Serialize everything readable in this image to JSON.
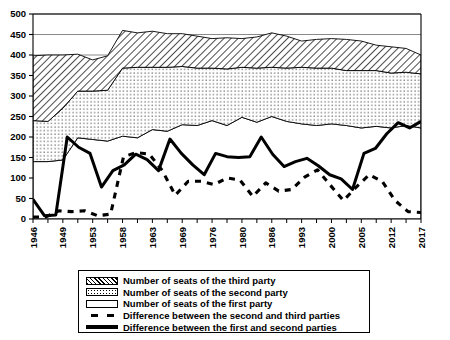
{
  "chart": {
    "type": "area",
    "title": "",
    "xlabel": "",
    "ylabel": "",
    "ylim": [
      0,
      500
    ],
    "ytick_step": 50,
    "grid": "horizontal gridlines at 400, 450, 500",
    "legend_position": "bottom",
    "colors": {
      "line": "#000000",
      "axis": "#000000",
      "gridline": "#808080",
      "background": "#ffffff"
    }
  },
  "legend": {
    "items": [
      {
        "label": "Number of seats of the third party",
        "swatch": "hatched"
      },
      {
        "label": "Number of seats of the second party",
        "swatch": "dotted"
      },
      {
        "label": "Number of seats of the first party",
        "swatch": "plain-white"
      },
      {
        "label": "Difference between the second and third parties",
        "swatch": "dashed-line"
      },
      {
        "label": "Difference between the first and second parties",
        "swatch": "solid-line"
      }
    ]
  },
  "axes": {
    "y_ticks": [
      "0",
      "50",
      "100",
      "150",
      "200",
      "250",
      "300",
      "350",
      "400",
      "450",
      "500"
    ],
    "x_tick_labels": [
      "1946",
      "1949",
      "1953",
      "1958",
      "1963",
      "1969",
      "1976",
      "1980",
      "1986",
      "1993",
      "2000",
      "2005",
      "2012",
      "2017"
    ],
    "x_tick_label_indices": [
      0,
      2,
      4,
      6,
      8,
      10,
      12,
      14,
      16,
      18,
      20,
      22,
      24,
      26
    ]
  },
  "chart_data": {
    "type": "area",
    "title": "",
    "xlabel": "",
    "ylabel": "",
    "ylim": [
      0,
      500
    ],
    "grid": true,
    "legend_position": "bottom",
    "x": [
      "1946",
      "1947",
      "1949",
      "1951",
      "1953",
      "1955",
      "1958",
      "1960",
      "1963",
      "1966",
      "1969",
      "1972",
      "1976",
      "1978",
      "1980",
      "1983",
      "1986",
      "1990",
      "1993",
      "1996",
      "2000",
      "2003",
      "2005",
      "2009",
      "2012",
      "2015",
      "2017"
    ],
    "categories": [
      "1946",
      "1947",
      "1949",
      "1951",
      "1953",
      "1955",
      "1958",
      "1960",
      "1963",
      "1966",
      "1969",
      "1972",
      "1976",
      "1978",
      "1980",
      "1983",
      "1986",
      "1990",
      "1993",
      "1996",
      "2000",
      "2003",
      "2005",
      "2009",
      "2012",
      "2015",
      "2017"
    ],
    "series": [
      {
        "name": "Number of seats of the first party",
        "stacked": true,
        "fill": "plain-white",
        "values": [
          140,
          140,
          144,
          198,
          194,
          190,
          202,
          198,
          218,
          214,
          230,
          228,
          240,
          228,
          248,
          236,
          250,
          238,
          232,
          228,
          232,
          228,
          222,
          226,
          222,
          228,
          222
        ]
      },
      {
        "name": "Number of seats of the second party",
        "stacked": true,
        "fill": "dotted",
        "values": [
          100,
          98,
          126,
          114,
          118,
          124,
          166,
          172,
          152,
          156,
          142,
          140,
          128,
          138,
          122,
          132,
          120,
          130,
          138,
          140,
          136,
          134,
          140,
          136,
          134,
          130,
          132
        ]
      },
      {
        "name": "Number of seats of the third party",
        "stacked": true,
        "fill": "hatched",
        "values": [
          158,
          162,
          130,
          90,
          76,
          84,
          92,
          84,
          88,
          82,
          80,
          78,
          72,
          76,
          70,
          76,
          84,
          78,
          64,
          70,
          72,
          76,
          72,
          62,
          64,
          58,
          46
        ]
      }
    ],
    "lines": [
      {
        "name": "Difference between the first and second parties",
        "style": "solid",
        "values": [
          48,
          8,
          10,
          200,
          175,
          160,
          78,
          118,
          132,
          158,
          145,
          118,
          195,
          160,
          132,
          108,
          160,
          152,
          150,
          152,
          200,
          158,
          128,
          140,
          148,
          130,
          108,
          98,
          72,
          160,
          172,
          208,
          235,
          222,
          238
        ]
      },
      {
        "name": "Difference between the second and third parties",
        "style": "dashed",
        "values": [
          5,
          5,
          20,
          18,
          20,
          8,
          12,
          152,
          162,
          158,
          118,
          58,
          92,
          92,
          84,
          100,
          95,
          55,
          88,
          68,
          72,
          102,
          120,
          82,
          45,
          78,
          108,
          92,
          45,
          18,
          16
        ]
      }
    ]
  }
}
